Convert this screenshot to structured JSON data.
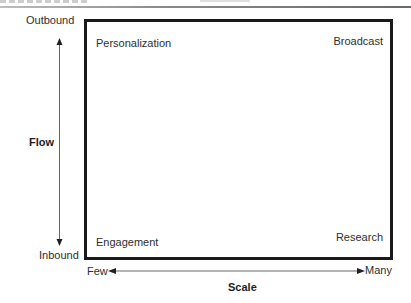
{
  "diagram": {
    "type": "2x2-matrix",
    "quadrants": {
      "top_left": "Personalization",
      "top_right": "Broadcast",
      "bottom_left": "Engagement",
      "bottom_right": "Research"
    },
    "y_axis": {
      "title": "Flow",
      "top_label": "Outbound",
      "bottom_label": "Inbound",
      "direction": "bidirectional"
    },
    "x_axis": {
      "title": "Scale",
      "left_label": "Few",
      "right_label": "Many",
      "direction": "bidirectional"
    },
    "colors": {
      "box_border": "#1a1a1a",
      "arrow": "#555555",
      "text": "#2e2e2e",
      "background": "#ffffff"
    }
  }
}
